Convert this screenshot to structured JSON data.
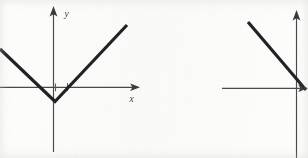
{
  "figure": {
    "background_color": "#fcfcfb",
    "ink_color": "#232326",
    "axis_color": "#4a4a4c",
    "panel_count": 2,
    "caption": ""
  },
  "chart_data": [
    {
      "type": "line",
      "name": "left-panel",
      "title": "",
      "xlabel": "x",
      "ylabel": "y",
      "description": "V-shaped absolute value graph with vertex just below the origin",
      "grid": false,
      "legend": "none",
      "axes": {
        "x_axis": {
          "label": "x",
          "arrow": "right",
          "origin_px": 53,
          "y_px": 87,
          "from_px": 0,
          "to_px": 140
        },
        "y_axis": {
          "label": "y",
          "arrow": "up",
          "x_px": 53,
          "from_px": 152,
          "to_px": 8
        }
      },
      "ticks": {
        "x": [
          1,
          2
        ],
        "x_px": [
          55,
          67
        ],
        "y": []
      },
      "series": [
        {
          "name": "v-curve",
          "points_px": [
            [
              0,
              49
            ],
            [
              55,
              101
            ],
            [
              127,
              25
            ]
          ],
          "points": [
            [
              -3.2,
              1.4
            ],
            [
              0.1,
              -0.75
            ],
            [
              4.6,
              3.9
            ]
          ],
          "vertex_px": [
            55,
            101
          ],
          "vertex": [
            0.1,
            -0.75
          ]
        }
      ]
    },
    {
      "type": "line",
      "name": "right-panel",
      "title": "",
      "xlabel": "",
      "ylabel": "",
      "description": "Descending straight line crossing the axes near the origin; panel is cropped at the right edge of the image",
      "grid": false,
      "legend": "none",
      "axes": {
        "x_axis": {
          "label": "",
          "arrow": "right",
          "origin_px": 296,
          "y_px": 88,
          "from_px": 222,
          "to_px": 308
        },
        "y_axis": {
          "label": "",
          "arrow": "up",
          "x_px": 296,
          "from_px": 158,
          "to_px": 12
        }
      },
      "ticks": {
        "x": [],
        "y": []
      },
      "series": [
        {
          "name": "descending-line",
          "points_px": [
            [
              248,
              22
            ],
            [
              306,
              90
            ]
          ],
          "points": [
            [
              -3.0,
              4.1
            ],
            [
              0.6,
              -0.1
            ]
          ],
          "slope": "negative"
        }
      ]
    }
  ],
  "labels": {
    "left_y": "y",
    "left_x": "x"
  }
}
